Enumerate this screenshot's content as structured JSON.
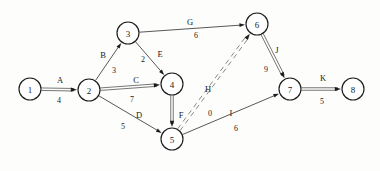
{
  "figure": {
    "kind": "directed-weighted-graph",
    "background_color": "#fdfdfc",
    "node_fill": "#ffffff",
    "node_stroke": "#1c1c1c",
    "edge_color": "#3a3a3a"
  },
  "nodes": [
    {
      "id": "1",
      "label": "1",
      "cx": 30,
      "cy": 89,
      "r": 11
    },
    {
      "id": "2",
      "label": "2",
      "cx": 89,
      "cy": 90,
      "r": 11
    },
    {
      "id": "3",
      "label": "3",
      "cx": 128,
      "cy": 33,
      "r": 11
    },
    {
      "id": "4",
      "label": "4",
      "cx": 172,
      "cy": 84,
      "r": 11
    },
    {
      "id": "5",
      "label": "5",
      "cx": 172,
      "cy": 139,
      "r": 11
    },
    {
      "id": "6",
      "label": "6",
      "cx": 257,
      "cy": 24,
      "r": 11
    },
    {
      "id": "7",
      "label": "7",
      "cx": 290,
      "cy": 89,
      "r": 11
    },
    {
      "id": "8",
      "label": "8",
      "cx": 353,
      "cy": 89,
      "r": 11
    }
  ],
  "edges": [
    {
      "id": "A",
      "letter": "A",
      "weight": "4",
      "from": "1",
      "to": "2",
      "style": "double",
      "letter_x": 60,
      "letter_y": 80,
      "weight_x": 59,
      "weight_y": 100
    },
    {
      "id": "B",
      "letter": "B",
      "weight": "3",
      "from": "2",
      "to": "3",
      "style": "thin",
      "letter_x": 103,
      "letter_y": 55,
      "weight_x": 114,
      "weight_y": 70
    },
    {
      "id": "C",
      "letter": "C",
      "weight": "7",
      "from": "2",
      "to": "4",
      "style": "double",
      "letter_x": 136,
      "letter_y": 80,
      "weight_x": 132,
      "weight_y": 99
    },
    {
      "id": "D",
      "letter": "D",
      "weight": "5",
      "from": "2",
      "to": "5",
      "style": "thin",
      "letter_x": 139,
      "letter_y": 115,
      "weight_x": 123,
      "weight_y": 126
    },
    {
      "id": "E",
      "letter": "E",
      "weight": "2",
      "from": "3",
      "to": "4",
      "style": "thin",
      "letter_x": 160,
      "letter_y": 54,
      "weight_x": 143,
      "weight_y": 59
    },
    {
      "id": "F",
      "letter": "F",
      "weight": "",
      "from": "4",
      "to": "5",
      "style": "double",
      "letter_x": 181,
      "letter_y": 115,
      "weight_x": 181,
      "weight_y": 127
    },
    {
      "id": "G",
      "letter": "G",
      "weight": "6",
      "from": "3",
      "to": "6",
      "style": "thin",
      "letter_x": 190,
      "letter_y": 22,
      "weight_x": 196,
      "weight_y": 35
    },
    {
      "id": "H",
      "letter": "H",
      "weight": "0",
      "from": "5",
      "to": "6",
      "style": "dashed",
      "letter_x": 208,
      "letter_y": 89,
      "weight_x": 210,
      "weight_y": 113
    },
    {
      "id": "I",
      "letter": "I",
      "weight": "6",
      "from": "5",
      "to": "7",
      "style": "thin",
      "letter_x": 231,
      "letter_y": 113,
      "weight_x": 236,
      "weight_y": 128
    },
    {
      "id": "J",
      "letter": "J",
      "weight": "9",
      "from": "6",
      "to": "7",
      "style": "double",
      "letter_x": 277,
      "letter_y": 50,
      "weight_x": 266,
      "weight_y": 69
    },
    {
      "id": "K",
      "letter": "K",
      "weight": "5",
      "from": "7",
      "to": "8",
      "style": "double",
      "letter_x": 323,
      "letter_y": 78,
      "weight_x": 322,
      "weight_y": 101
    }
  ]
}
